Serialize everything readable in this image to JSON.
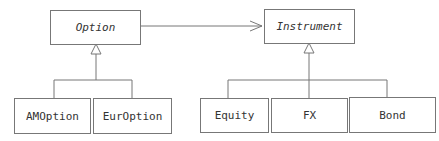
{
  "diagram": {
    "type": "UML class diagram",
    "classes": [
      {
        "id": "option",
        "name": "Option",
        "abstract": true
      },
      {
        "id": "instrument",
        "name": "Instrument",
        "abstract": true
      },
      {
        "id": "amoption",
        "name": "AMOption"
      },
      {
        "id": "euroption",
        "name": "EurOption"
      },
      {
        "id": "equity",
        "name": "Equity"
      },
      {
        "id": "fx",
        "name": "FX"
      },
      {
        "id": "bond",
        "name": "Bond"
      }
    ],
    "relations": [
      {
        "from": "option",
        "to": "instrument",
        "type": "association"
      },
      {
        "from": "amoption",
        "to": "option",
        "type": "inheritance"
      },
      {
        "from": "euroption",
        "to": "option",
        "type": "inheritance"
      },
      {
        "from": "equity",
        "to": "instrument",
        "type": "inheritance"
      },
      {
        "from": "fx",
        "to": "instrument",
        "type": "inheritance"
      },
      {
        "from": "bond",
        "to": "instrument",
        "type": "inheritance"
      }
    ]
  }
}
